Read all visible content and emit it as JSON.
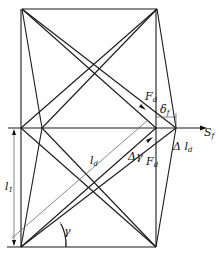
{
  "diagram": {
    "type": "truss-shear-deformation",
    "labels": {
      "force_top": {
        "main": "F",
        "sub": "d"
      },
      "delta": {
        "main": "δ",
        "sub": "f"
      },
      "shear": {
        "main": "S",
        "sub": "f"
      },
      "force_bottom": {
        "main": "F",
        "sub": "d"
      },
      "delta_l": {
        "main": "Δ l",
        "sub": "d"
      },
      "diag_length": {
        "main": "l",
        "sub": "d"
      },
      "height": {
        "main": "l",
        "sub": "1"
      },
      "delta_gamma": {
        "main": "Δγ"
      },
      "angle": {
        "main": "γ"
      }
    }
  }
}
